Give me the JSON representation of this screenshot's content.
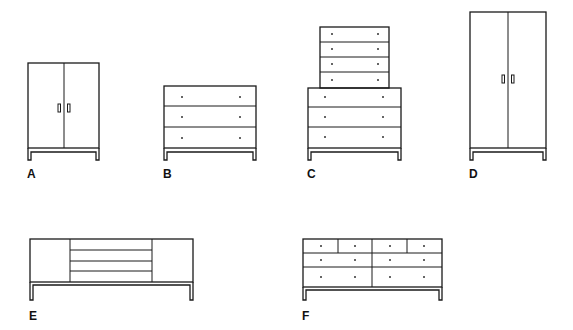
{
  "figure": {
    "items": [
      {
        "id": "A",
        "label": "A",
        "type": "two-door cabinet",
        "doors": 2,
        "drawers": 0
      },
      {
        "id": "B",
        "label": "B",
        "type": "three-drawer chest",
        "doors": 0,
        "drawers": 3
      },
      {
        "id": "C",
        "label": "C",
        "type": "chest with four-drawer top unit",
        "doors": 0,
        "drawers": 7
      },
      {
        "id": "D",
        "label": "D",
        "type": "tall two-door wardrobe",
        "doors": 2,
        "drawers": 0
      },
      {
        "id": "E",
        "label": "E",
        "type": "sideboard with center drawers",
        "doors": 2,
        "drawers": 4
      },
      {
        "id": "F",
        "label": "F",
        "type": "eight-drawer dresser",
        "doors": 0,
        "drawers": 8
      }
    ],
    "colors": {
      "stroke": "#1a1a1a",
      "background": "#ffffff"
    }
  }
}
